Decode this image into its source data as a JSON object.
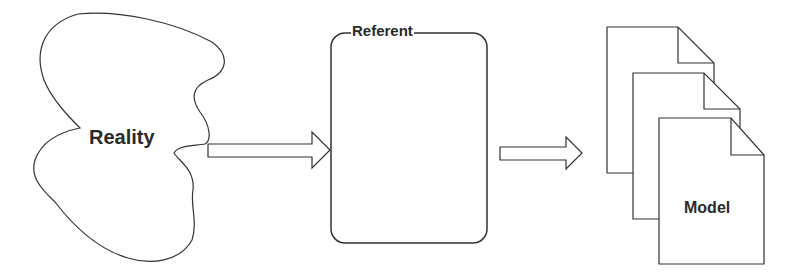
{
  "diagram": {
    "nodes": [
      {
        "id": "reality",
        "label": "Reality",
        "shape": "blob"
      },
      {
        "id": "referent",
        "label": "Referent",
        "shape": "rounded-rectangle"
      },
      {
        "id": "model",
        "label": "Model",
        "shape": "stacked-documents",
        "count": 3
      }
    ],
    "edges": [
      {
        "from": "reality",
        "to": "referent",
        "style": "block-arrow"
      },
      {
        "from": "referent",
        "to": "model",
        "style": "block-arrow"
      }
    ],
    "colors": {
      "stroke": "#333333",
      "background": "#ffffff",
      "text": "#2a2a2a"
    }
  }
}
